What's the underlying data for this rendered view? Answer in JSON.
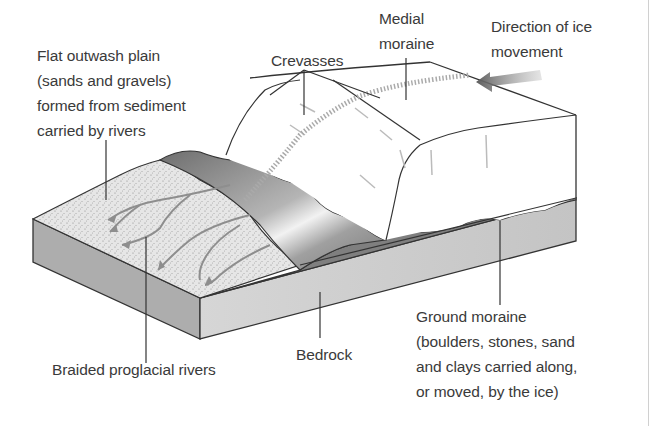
{
  "diagram": {
    "colors": {
      "text": "#3a3a3a",
      "outline": "#333333",
      "ice": "#ffffff",
      "bedrock_front": "#c8c8c8",
      "bedrock_side": "#a9a9a9",
      "ground_moraine": "#7d7d7d",
      "outwash": "#e4e4e4",
      "moraine_hills": "#8f8f8f",
      "arrow": "#6a6a6a"
    },
    "labels": {
      "outwash_plain": "Flat outwash plain\n(sands and gravels)\nformed from sediment\ncarried by rivers",
      "crevasses": "Crevasses",
      "medial_moraine": "Medial\nmoraine",
      "ice_direction": "Direction of ice\nmovement",
      "braided_rivers": "Braided proglacial rivers",
      "bedrock": "Bedrock",
      "ground_moraine": "Ground moraine\n(boulders, stones, sand\nand clays carried along,\nor moved, by the ice)"
    }
  }
}
